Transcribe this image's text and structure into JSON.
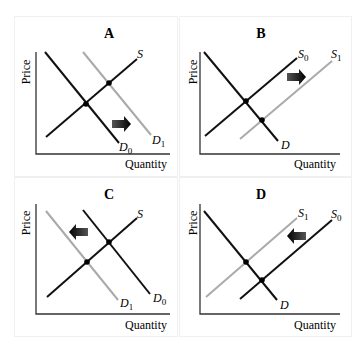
{
  "panels": [
    {
      "id": "A",
      "title": "A",
      "xlabel": "Quantity",
      "ylabel": "Price",
      "curves": [
        {
          "name": "S",
          "label": "S",
          "sub": "",
          "color": "#111111"
        },
        {
          "name": "D0",
          "label": "D",
          "sub": "0",
          "color": "#111111"
        },
        {
          "name": "D1",
          "label": "D",
          "sub": "1",
          "color": "#aaaaaa"
        }
      ],
      "shift": "right",
      "description": "Demand shifts right from D0 to D1"
    },
    {
      "id": "B",
      "title": "B",
      "xlabel": "Quantity",
      "ylabel": "Price",
      "curves": [
        {
          "name": "S0",
          "label": "S",
          "sub": "0",
          "color": "#111111"
        },
        {
          "name": "S1",
          "label": "S",
          "sub": "1",
          "color": "#aaaaaa"
        },
        {
          "name": "D",
          "label": "D",
          "sub": "",
          "color": "#111111"
        }
      ],
      "shift": "right",
      "description": "Supply shifts right from S0 to S1"
    },
    {
      "id": "C",
      "title": "C",
      "xlabel": "Quantity",
      "ylabel": "Price",
      "curves": [
        {
          "name": "S",
          "label": "S",
          "sub": "",
          "color": "#111111"
        },
        {
          "name": "D0",
          "label": "D",
          "sub": "0",
          "color": "#111111"
        },
        {
          "name": "D1",
          "label": "D",
          "sub": "1",
          "color": "#aaaaaa"
        }
      ],
      "shift": "left",
      "description": "Demand shifts left from D0 to D1"
    },
    {
      "id": "D",
      "title": "D",
      "xlabel": "Quantity",
      "ylabel": "Price",
      "curves": [
        {
          "name": "S0",
          "label": "S",
          "sub": "0",
          "color": "#111111"
        },
        {
          "name": "S1",
          "label": "S",
          "sub": "1",
          "color": "#aaaaaa"
        },
        {
          "name": "D",
          "label": "D",
          "sub": "",
          "color": "#111111"
        }
      ],
      "shift": "left",
      "description": "Supply shifts left from S0 to S1"
    }
  ]
}
